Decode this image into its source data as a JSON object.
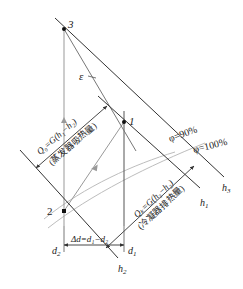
{
  "diagram": {
    "type": "psychrometric-h-d-chart",
    "points": [
      {
        "id": "3",
        "label": "3",
        "x": 64,
        "y": 29
      },
      {
        "id": "1",
        "label": "1",
        "x": 124,
        "y": 122
      },
      {
        "id": "2",
        "label": "2",
        "x": 64,
        "y": 211
      }
    ],
    "labels": {
      "point3": "3",
      "point1": "1",
      "point2": "2",
      "epsilon": "ε",
      "phi90": "φ=90%",
      "phi100": "φ=100%",
      "h3": "h",
      "h3_sub": "3",
      "h1": "h",
      "h1_sub": "1",
      "h2": "h",
      "h2_sub": "2",
      "d2": "d",
      "d2_sub": "2",
      "d1": "d",
      "d1_sub": "1",
      "delta_d": "Δd=d₁−d₂",
      "q0_formula": "Q₀=G(h₁−h₂)",
      "q0_desc": "(蒸发器吸热量)",
      "qk_formula": "Qₖ=G(h₃−h₂)",
      "qk_desc": "(冷凝器排热量)"
    },
    "colors": {
      "line": "#333333",
      "gray_line": "#aaaaaa",
      "curve": "#bbbbbb",
      "text": "#222222"
    }
  }
}
